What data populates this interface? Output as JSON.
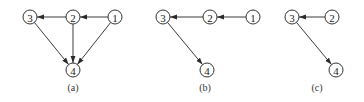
{
  "diagram": {
    "type": "directed-graphs",
    "colors": {
      "stroke": "#3a3a3a",
      "node_fill": "#ffffff",
      "text": "#222222"
    },
    "node_radius": 7,
    "graphs": [
      {
        "caption": "(a)",
        "caption_pos": {
          "x": 73,
          "y": 87
        },
        "nodes": [
          {
            "id": "1",
            "label": "1",
            "x": 115,
            "y": 17
          },
          {
            "id": "2",
            "label": "2",
            "x": 73,
            "y": 17
          },
          {
            "id": "3",
            "label": "3",
            "x": 30,
            "y": 17
          },
          {
            "id": "4",
            "label": "4",
            "x": 73,
            "y": 70
          }
        ],
        "edges": [
          {
            "from": "1",
            "to": "2"
          },
          {
            "from": "2",
            "to": "3"
          },
          {
            "from": "2",
            "to": "4"
          },
          {
            "from": "3",
            "to": "4"
          },
          {
            "from": "1",
            "to": "4"
          }
        ]
      },
      {
        "caption": "(b)",
        "caption_pos": {
          "x": 205,
          "y": 87
        },
        "nodes": [
          {
            "id": "1",
            "label": "1",
            "x": 253,
            "y": 17
          },
          {
            "id": "2",
            "label": "2",
            "x": 210,
            "y": 17
          },
          {
            "id": "3",
            "label": "3",
            "x": 163,
            "y": 17
          },
          {
            "id": "4",
            "label": "4",
            "x": 207,
            "y": 70
          }
        ],
        "edges": [
          {
            "from": "1",
            "to": "2"
          },
          {
            "from": "2",
            "to": "3"
          },
          {
            "from": "3",
            "to": "4"
          }
        ]
      },
      {
        "caption": "(c)",
        "caption_pos": {
          "x": 317,
          "y": 87
        },
        "nodes": [
          {
            "id": "2",
            "label": "2",
            "x": 332,
            "y": 17
          },
          {
            "id": "3",
            "label": "3",
            "x": 292,
            "y": 17
          },
          {
            "id": "4",
            "label": "4",
            "x": 336,
            "y": 70
          }
        ],
        "edges": [
          {
            "from": "2",
            "to": "3"
          },
          {
            "from": "3",
            "to": "4"
          }
        ]
      }
    ]
  }
}
